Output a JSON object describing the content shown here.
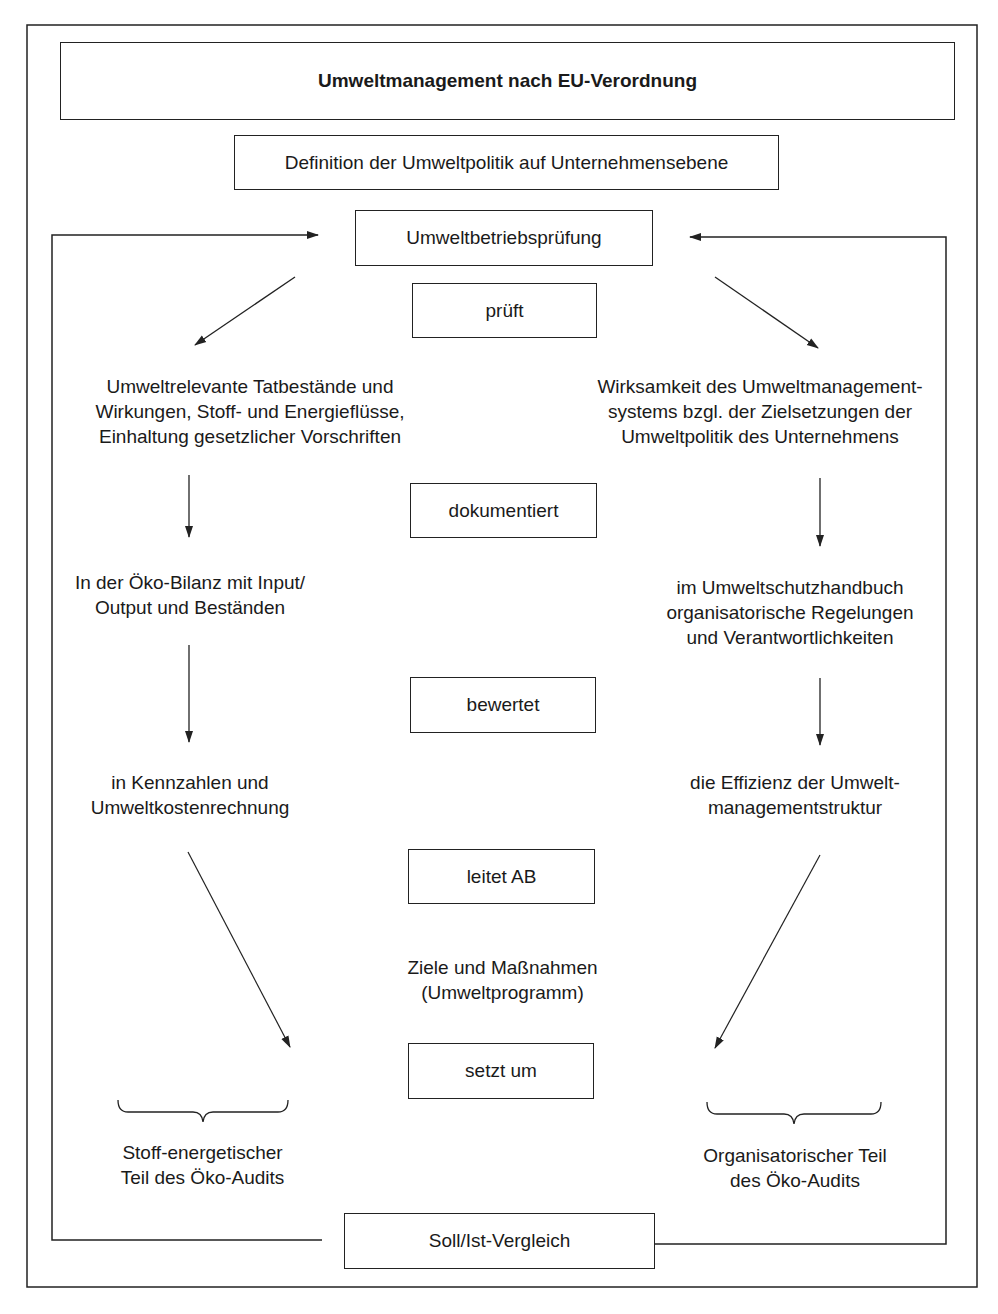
{
  "title": "Umweltmanagement nach EU-Verordnung",
  "definition": "Definition der Umweltpolitik auf Unternehmensebene",
  "audit": "Umweltbetriebsprüfung",
  "steps": {
    "check": "prüft",
    "document": "dokumentiert",
    "evaluate": "bewertet",
    "derive": "leitet AB",
    "implement": "setzt um"
  },
  "left_column": {
    "examined": "Umweltrelevante Tatbestände und\nWirkungen, Stoff- und Energieflüsse,\nEinhaltung gesetzlicher Vorschriften",
    "documented": "In der Öko-Bilanz mit Input/\nOutput und Beständen",
    "evaluated": "in Kennzahlen und\nUmweltkostenrechnung",
    "summary": "Stoff-energetischer\nTeil des Öko-Audits"
  },
  "right_column": {
    "examined": "Wirksamkeit des Umweltmanagement-\nsystems bzgl. der Zielsetzungen der\nUmweltpolitik des Unternehmens",
    "documented": "im Umweltschutzhandbuch\norganisatorische Regelungen\nund Verantwortlichkeiten",
    "evaluated": "die Effizienz der Umwelt-\nmanagementstruktur",
    "summary": "Organisatorischer Teil\ndes Öko-Audits"
  },
  "center": {
    "goals": "Ziele und Maßnahmen\n(Umweltprogramm)"
  },
  "comparison": "Soll/Ist-Vergleich"
}
